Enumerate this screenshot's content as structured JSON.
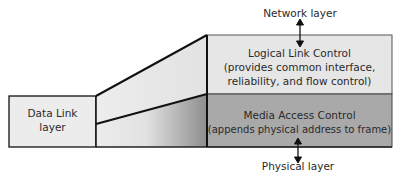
{
  "diagram": {
    "top_label": "Network layer",
    "bottom_label": "Physical layer",
    "left_box": {
      "line1": "Data Link",
      "line2": "layer"
    },
    "upper_block": {
      "title": "Logical Link Control",
      "desc1": "(provides common interface,",
      "desc2": "reliability, and flow control)"
    },
    "lower_block": {
      "title": "Media Access Control",
      "desc1": "(appends physical address to frame)"
    },
    "colors": {
      "upper_fill": "#e6e6e6",
      "lower_fill": "#a9a9a9",
      "left_fill": "#ececec",
      "stroke": "#111111"
    }
  }
}
